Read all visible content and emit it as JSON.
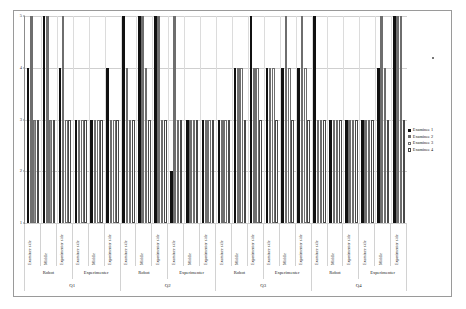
{
  "chart_data": {
    "type": "bar",
    "title": "",
    "xlabel": "",
    "ylabel": "",
    "ylim": [
      1,
      5
    ],
    "yticks": [
      1,
      2,
      3,
      4,
      5
    ],
    "grid": true,
    "legend_position": "right",
    "series": [
      {
        "name": "Examinee 1",
        "color": "#111111",
        "values": [
          4,
          5,
          4,
          3,
          3,
          4,
          5,
          5,
          5,
          2,
          3,
          3,
          3,
          4,
          5,
          4,
          4,
          4,
          5,
          3,
          3,
          3,
          4,
          5
        ]
      },
      {
        "name": "Examinee 2",
        "color": "#6e6e6e",
        "values": [
          5,
          5,
          5,
          3,
          3,
          3,
          4,
          5,
          5,
          5,
          3,
          3,
          3,
          4,
          4,
          4,
          5,
          5,
          3,
          3,
          3,
          3,
          5,
          5
        ]
      },
      {
        "name": "Examinee 3",
        "color": "#b4b4b4",
        "values": [
          3,
          3,
          3,
          3,
          3,
          3,
          3,
          4,
          3,
          3,
          3,
          3,
          3,
          4,
          4,
          4,
          4,
          4,
          3,
          3,
          3,
          3,
          4,
          5
        ]
      },
      {
        "name": "Examinee 4",
        "color": "#ffffff",
        "values": [
          3,
          3,
          3,
          3,
          3,
          3,
          3,
          3,
          3,
          3,
          3,
          3,
          3,
          3,
          3,
          3,
          3,
          3,
          3,
          3,
          3,
          3,
          3,
          3
        ]
      }
    ],
    "categories": [
      "Examinee side",
      "Middle",
      "Experimenter side",
      "Examinee side",
      "Middle",
      "Experimenter side",
      "Examinee side",
      "Middle",
      "Experimenter side",
      "Examinee side",
      "Middle",
      "Experimenter side",
      "Examinee side",
      "Middle",
      "Experimenter side",
      "Examinee side",
      "Middle",
      "Experimenter side",
      "Examinee side",
      "Middle",
      "Experimenter side",
      "Examinee side",
      "Middle",
      "Experimenter side"
    ],
    "group_labels": [
      "Robot",
      "Experimenter",
      "Robot",
      "Experimenter",
      "Robot",
      "Experimenter",
      "Robot",
      "Experimenter"
    ],
    "question_labels": [
      "Q1",
      "Q2",
      "Q3",
      "Q4"
    ]
  },
  "legend": {
    "items": [
      {
        "label": "Examinee 1"
      },
      {
        "label": "Examinee 2"
      },
      {
        "label": "Examinee 3"
      },
      {
        "label": "Examinee 4"
      }
    ]
  }
}
